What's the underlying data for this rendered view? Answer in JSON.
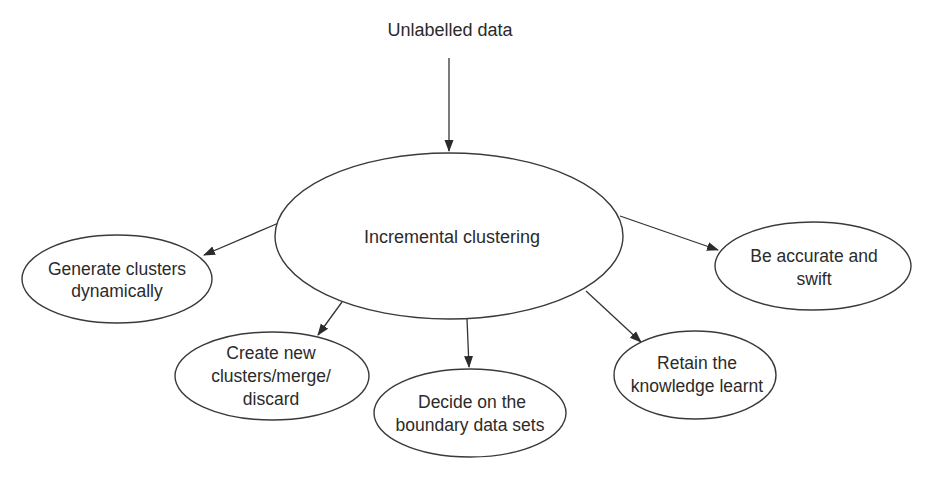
{
  "diagram": {
    "source_label": "Unlabelled data",
    "center": {
      "label": "Incremental clustering"
    },
    "nodes": [
      {
        "id": "generate",
        "lines": [
          "Generate clusters",
          "dynamically"
        ]
      },
      {
        "id": "create",
        "lines": [
          "Create new",
          "clusters/merge/",
          "discard"
        ]
      },
      {
        "id": "decide",
        "lines": [
          "Decide on the",
          "boundary data sets"
        ]
      },
      {
        "id": "retain",
        "lines": [
          "Retain the",
          "knowledge learnt"
        ]
      },
      {
        "id": "accurate",
        "lines": [
          "Be accurate and",
          "swift"
        ]
      }
    ],
    "edges": [
      {
        "from": "Unlabelled data",
        "to": "Incremental clustering"
      },
      {
        "from": "Incremental clustering",
        "to": "Generate clusters dynamically"
      },
      {
        "from": "Incremental clustering",
        "to": "Create new clusters/merge/discard"
      },
      {
        "from": "Incremental clustering",
        "to": "Decide on the boundary data sets"
      },
      {
        "from": "Incremental clustering",
        "to": "Retain the knowledge learnt"
      },
      {
        "from": "Incremental clustering",
        "to": "Be accurate and swift"
      }
    ]
  }
}
